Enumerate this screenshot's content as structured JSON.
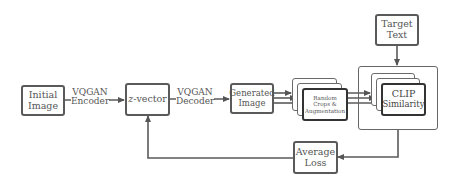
{
  "diagram": {
    "type": "flowchart",
    "nodes": {
      "initial_image": {
        "line1": "Initial",
        "line2": "Image"
      },
      "z_vector": {
        "prefix": "z",
        "suffix": "-vector"
      },
      "generated_image": {
        "line1": "Generated",
        "line2": "Image"
      },
      "random_crops": {
        "line1": "Random",
        "line2": "Crops &",
        "line3": "Augmentation"
      },
      "clip_similarity": {
        "line1": "CLIP",
        "line2": "Similarity"
      },
      "target_text": {
        "line1": "Target",
        "line2": "Text"
      },
      "average_loss": {
        "line1": "Average",
        "line2": "Loss"
      }
    },
    "edges": {
      "encoder": {
        "line1": "VQGAN",
        "line2": "Encoder"
      },
      "decoder": {
        "line1": "VQGAN",
        "line2": "Decoder"
      }
    },
    "colors": {
      "stroke": "#5a5a5a",
      "text": "#555555",
      "background": "#ffffff"
    }
  }
}
